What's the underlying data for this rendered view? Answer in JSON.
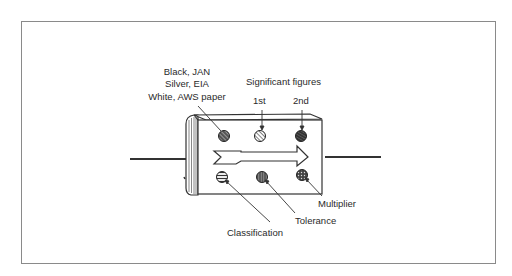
{
  "figure": {
    "labels": {
      "classification_top_line1": "Black, JAN",
      "classification_top_line2": "Silver, EIA",
      "classification_top_line3": "White, AWS paper",
      "significant_figures": "Significant figures",
      "first": "1st",
      "second": "2nd",
      "multiplier": "Multiplier",
      "tolerance": "Tolerance",
      "classification": "Classification"
    },
    "dots": [
      {
        "position": "top-left",
        "meaning": "Classification type (Black JAN / Silver EIA / White AWS paper)",
        "pattern": "diagonal-dense"
      },
      {
        "position": "top-middle",
        "meaning": "1st significant figure",
        "pattern": "diagonal-light"
      },
      {
        "position": "top-right",
        "meaning": "2nd significant figure",
        "pattern": "dark-hatched"
      },
      {
        "position": "bottom-left",
        "meaning": "Classification",
        "pattern": "horizontal"
      },
      {
        "position": "bottom-middle",
        "meaning": "Tolerance",
        "pattern": "vertical"
      },
      {
        "position": "bottom-right",
        "meaning": "Multiplier",
        "pattern": "dotted"
      }
    ],
    "colors": {
      "ink": "#2a2a2a",
      "frame": "#8a8a8a",
      "background": "#ffffff"
    }
  }
}
